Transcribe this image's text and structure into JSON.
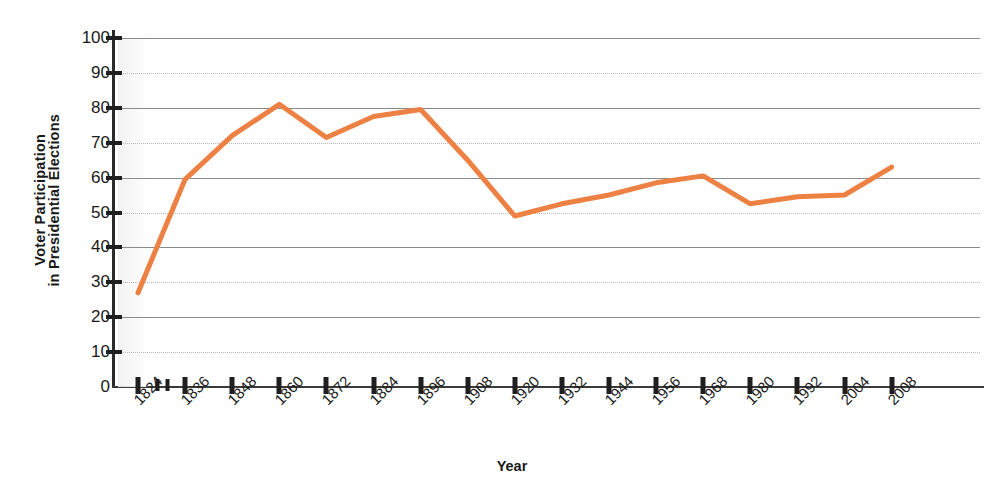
{
  "chart_data": {
    "type": "line",
    "title": "",
    "xlabel": "Year",
    "ylabel": "Voter Participation in Presidential Elections",
    "ylabel_lines": [
      "Voter Participation",
      "in Presidential Elections"
    ],
    "categories": [
      1824,
      1836,
      1848,
      1860,
      1872,
      1884,
      1896,
      1908,
      1920,
      1932,
      1944,
      1956,
      1968,
      1980,
      1992,
      2004,
      2008
    ],
    "x_tick_labels": [
      "1824",
      "1836",
      "1848",
      "1860",
      "1872",
      "1884",
      "1896",
      "1908",
      "1920",
      "1932",
      "1944",
      "1956",
      "1968",
      "1980",
      "1992",
      "2004",
      "2008"
    ],
    "y_tick_labels": [
      "0",
      "10",
      "20",
      "30",
      "40",
      "50",
      "60",
      "70",
      "80",
      "90",
      "100"
    ],
    "y_ticks": [
      0,
      10,
      20,
      30,
      40,
      50,
      60,
      70,
      80,
      90,
      100
    ],
    "ylim": [
      0,
      100
    ],
    "grid": true,
    "legend": "none",
    "series": [
      {
        "name": "Voter Participation",
        "color": "#ED8144",
        "values": [
          27,
          59.5,
          72,
          81,
          71.5,
          77.5,
          79.5,
          65,
          49,
          52.5,
          55,
          58.5,
          60.5,
          52.5,
          54.5,
          55,
          63
        ]
      }
    ],
    "points": [
      {
        "year": "1824",
        "value": 27
      },
      {
        "year": "1836",
        "value": 59.5
      },
      {
        "year": "1848",
        "value": 72
      },
      {
        "year": "1860",
        "value": 81
      },
      {
        "year": "1872",
        "value": 71.5
      },
      {
        "year": "1884",
        "value": 77.5
      },
      {
        "year": "1896",
        "value": 79.5
      },
      {
        "year": "1908",
        "value": 65
      },
      {
        "year": "1920",
        "value": 49
      },
      {
        "year": "1932",
        "value": 52.5
      },
      {
        "year": "1944",
        "value": 55
      },
      {
        "year": "1956",
        "value": 58.5
      },
      {
        "year": "1968",
        "value": 60.5
      },
      {
        "year": "1980",
        "value": 52.5
      },
      {
        "year": "1992",
        "value": 54.5
      },
      {
        "year": "2004",
        "value": 55
      },
      {
        "year": "2008",
        "value": 63
      }
    ],
    "colors": {
      "line": "#ED8144",
      "gridline_major": "#8b8b8b",
      "gridline_minor": "#b9b9b9",
      "axis": "#1f1f1f",
      "text": "#1a1a1a",
      "background": "#ffffff"
    },
    "line_width": 5
  }
}
